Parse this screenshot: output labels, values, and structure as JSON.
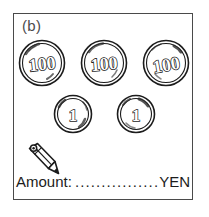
{
  "panel": {
    "label": "(b)"
  },
  "coins": {
    "row_100": [
      {
        "denomination": "100",
        "icon": "coin-100-yen-icon"
      },
      {
        "denomination": "100",
        "icon": "coin-100-yen-icon"
      },
      {
        "denomination": "100",
        "icon": "coin-100-yen-icon"
      }
    ],
    "row_1": [
      {
        "denomination": "1",
        "icon": "coin-1-yen-icon"
      },
      {
        "denomination": "1",
        "icon": "coin-1-yen-icon"
      }
    ]
  },
  "pencil": {
    "icon": "pencil-icon"
  },
  "amount": {
    "label": "Amount:",
    "dots": "......................",
    "unit": "YEN",
    "value": ""
  },
  "colors": {
    "ink": "#1c1c1c",
    "frame": "#4a4a4a",
    "label": "#4c4c4c",
    "paper": "#ffffff"
  }
}
